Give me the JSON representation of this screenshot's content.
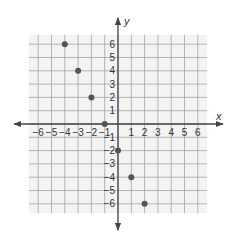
{
  "chart_data": {
    "type": "scatter",
    "title": "",
    "xlabel": "x",
    "ylabel": "y",
    "xlim": [
      -6,
      6
    ],
    "ylim": [
      -6,
      6
    ],
    "grid": true,
    "legend": null,
    "x_ticks": [
      -6,
      -5,
      -4,
      -3,
      -2,
      -1,
      1,
      2,
      3,
      4,
      5,
      6
    ],
    "y_ticks": [
      -6,
      -5,
      -4,
      -3,
      -2,
      -1,
      1,
      2,
      3,
      4,
      5,
      6
    ],
    "x_tick_labels": [
      "−6",
      "−5",
      "−4",
      "−3",
      "−2",
      "−1",
      "1",
      "2",
      "3",
      "4",
      "5",
      "6"
    ],
    "y_tick_labels": [
      "−6",
      "−5",
      "−4",
      "−3",
      "−2",
      "−1",
      "1",
      "2",
      "3",
      "4",
      "5",
      "6"
    ],
    "series": [
      {
        "name": "points",
        "points": [
          {
            "x": -4,
            "y": 6
          },
          {
            "x": -3,
            "y": 4
          },
          {
            "x": -2,
            "y": 2
          },
          {
            "x": -1,
            "y": 0
          },
          {
            "x": 0,
            "y": -2
          },
          {
            "x": 1,
            "y": -4
          },
          {
            "x": 2,
            "y": -6
          }
        ]
      }
    ]
  },
  "colors": {
    "grid_line": "#9a9a9a",
    "grid_bg": "#f3f3f3",
    "axis": "#444444",
    "point": "#555555",
    "label": "#333333"
  },
  "labels": {
    "x_axis": "x",
    "y_axis": "y"
  }
}
